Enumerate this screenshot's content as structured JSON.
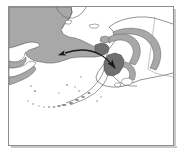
{
  "figure": {
    "kind": "reference-map",
    "region_label": "Beringia (Chukotka - Alaska)",
    "frame": {
      "x": 8,
      "y": 6,
      "width": 166,
      "height": 140
    }
  },
  "colors": {
    "background": "#ffffff",
    "ocean": "#ffffff",
    "land_fill": "#a8a8a8",
    "land_fill_dark": "#6f6f6f",
    "coastline": "#5a5a5a",
    "border_line": "#9a9a9a",
    "frame": "#8e8e8e",
    "arrow": "#1a1a1a",
    "shadow": "#c9c9c9"
  },
  "map_features": {
    "shaded_regions": [
      {
        "name": "chukotka-shaded-range",
        "label": "Chukotka shaded range",
        "fill": "#a8a8a8"
      },
      {
        "name": "alaska-interior-arc",
        "label": "Alaska interior arc range",
        "fill": "#a8a8a8"
      },
      {
        "name": "seward-peninsula-dark",
        "label": "Seward Peninsula dark patch",
        "fill": "#6f6f6f"
      },
      {
        "name": "western-alaska-dark",
        "label": "Western Alaska dark patch",
        "fill": "#6f6f6f"
      }
    ],
    "coast_outlines": [
      "siberia-arctic-coast",
      "chukotka-coast",
      "kamchatka-north-coast",
      "alaska-north-slope",
      "alaska-west-coast",
      "alaska-south-coast",
      "alaska-peninsula",
      "aleutian-islands",
      "kodiak-island",
      "st-lawrence-island",
      "wrangel-island"
    ],
    "political_lines": [
      {
        "name": "alaska-canada-border",
        "label": "Alaska-Canada border"
      }
    ]
  },
  "annotation": {
    "arrow": {
      "name": "migration-arrow",
      "label": "Double-headed migration arrow across Bering Strait",
      "style": "curved double-headed",
      "head_west": "Chukotka / Siberia",
      "head_east": "Western Alaska"
    }
  }
}
